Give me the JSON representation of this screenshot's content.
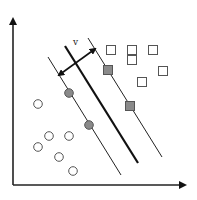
{
  "diagram": {
    "title": "",
    "margin_label": "v",
    "axes": {
      "origin": [
        13,
        185
      ],
      "y_tip": [
        13,
        13
      ],
      "x_tip": [
        191,
        185
      ]
    },
    "hyperplane": {
      "x1": 65,
      "y1": 46,
      "x2": 138,
      "y2": 163,
      "width": 2.2
    },
    "margins": [
      {
        "name": "lower-margin",
        "x1": 48,
        "y1": 57,
        "x2": 121,
        "y2": 175
      },
      {
        "name": "upper-margin",
        "x1": 88,
        "y1": 38,
        "x2": 162,
        "y2": 157
      }
    ],
    "margin_arrow": {
      "x1": 59,
      "y1": 75,
      "x2": 95,
      "y2": 49,
      "label_x": 73,
      "label_y": 45
    },
    "class_circles": {
      "open": [
        [
          38,
          104
        ],
        [
          49,
          136
        ],
        [
          69,
          136
        ],
        [
          38,
          147
        ],
        [
          59,
          157
        ],
        [
          73,
          171
        ]
      ],
      "support_vectors": [
        [
          69,
          93
        ],
        [
          89,
          125
        ]
      ]
    },
    "class_squares": {
      "open": [
        [
          111,
          50
        ],
        [
          132,
          50
        ],
        [
          153,
          50
        ],
        [
          132,
          60
        ],
        [
          163,
          71
        ],
        [
          142,
          82
        ]
      ],
      "support_vectors": [
        [
          108,
          70
        ],
        [
          130,
          106
        ]
      ]
    },
    "colors": {
      "stroke": "#222222",
      "point_stroke": "#555555",
      "support_fill": "#8a8a8a"
    }
  }
}
